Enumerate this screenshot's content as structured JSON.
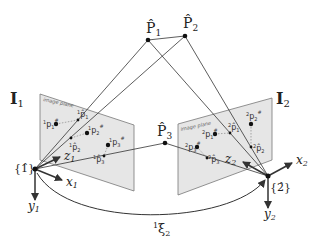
{
  "diagram": {
    "world_points": [
      {
        "id": "P1",
        "label": "P̂",
        "sub": "1"
      },
      {
        "id": "P2",
        "label": "P̂",
        "sub": "2"
      },
      {
        "id": "P3",
        "label": "P̂",
        "sub": "3"
      }
    ],
    "cameras": [
      {
        "id": "cam1",
        "image_label": "I",
        "image_sub": "1",
        "plane_text": "image plane",
        "frame_label": "{1̂}",
        "axes": {
          "x": "x",
          "x_sub": "1",
          "y": "y",
          "y_sub": "1",
          "z": "z",
          "z_sub": "1"
        },
        "points": [
          {
            "label": "p",
            "pre": "1",
            "sub": "1",
            "sup": "#"
          },
          {
            "label": "p̂",
            "pre": "1",
            "sub": "1"
          },
          {
            "label": "p",
            "pre": "1",
            "sub": "2",
            "sup": "#"
          },
          {
            "label": "p̂",
            "pre": "1",
            "sub": "2"
          },
          {
            "label": "p",
            "pre": "1",
            "sub": "3",
            "sup": "#"
          },
          {
            "label": "p̂",
            "pre": "1",
            "sub": "3"
          }
        ]
      },
      {
        "id": "cam2",
        "image_label": "I",
        "image_sub": "2",
        "plane_text": "image plane",
        "frame_label": "{2̂}",
        "axes": {
          "x": "x",
          "x_sub": "2",
          "y": "y",
          "y_sub": "2",
          "z": "z",
          "z_sub": "2"
        },
        "points": [
          {
            "label": "p",
            "pre": "2",
            "sub": "1",
            "sup": "#"
          },
          {
            "label": "p̂",
            "pre": "2",
            "sub": "1"
          },
          {
            "label": "p",
            "pre": "2",
            "sub": "2",
            "sup": "#"
          },
          {
            "label": "p̂",
            "pre": "2",
            "sub": "2"
          },
          {
            "label": "p",
            "pre": "2",
            "sub": "3",
            "sup": "#"
          },
          {
            "label": "p̂",
            "pre": "2",
            "sub": "3"
          }
        ]
      }
    ],
    "transform": {
      "pre": "1",
      "label": "ξ",
      "sub": "2"
    }
  },
  "colors": {
    "plane_fill": "#e6e6e6",
    "plane_stroke": "#777777",
    "line": "#333333",
    "point": "#111111"
  }
}
